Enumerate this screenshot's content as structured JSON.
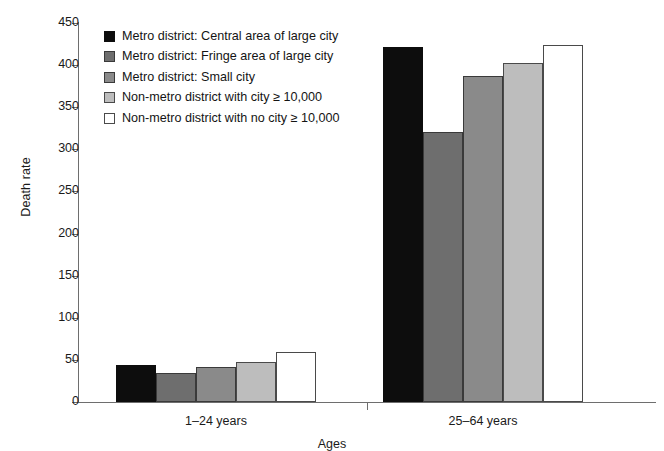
{
  "chart_data": {
    "type": "bar",
    "title": "",
    "subtitle": "",
    "xlabel": "Ages",
    "ylabel": "Death rate",
    "categories": [
      "1–24 years",
      "25–64 years"
    ],
    "ylim": [
      0,
      450
    ],
    "yticks": [
      0,
      50,
      100,
      150,
      200,
      250,
      300,
      350,
      400,
      450
    ],
    "ytick_labels": [
      "0",
      "50",
      "100",
      "150",
      "200",
      "250",
      "300",
      "350",
      "400",
      "450"
    ],
    "grid": false,
    "legend_position": "upper-left-inside",
    "series": [
      {
        "name": "Metro district: Central area of large city",
        "color": "#0d0d0d",
        "values": [
          44,
          421
        ]
      },
      {
        "name": "Metro district: Fringe area of large city",
        "color": "#6e6e6e",
        "values": [
          35,
          321
        ]
      },
      {
        "name": "Metro district: Small city",
        "color": "#8a8a8a",
        "values": [
          42,
          387
        ]
      },
      {
        "name": "Non-metro district with city ≥ 10,000",
        "color": "#bdbdbd",
        "values": [
          47,
          402
        ]
      },
      {
        "name": "Non-metro district with no city  ≥ 10,000",
        "color": "#ffffff",
        "values": [
          59,
          424
        ]
      }
    ]
  }
}
